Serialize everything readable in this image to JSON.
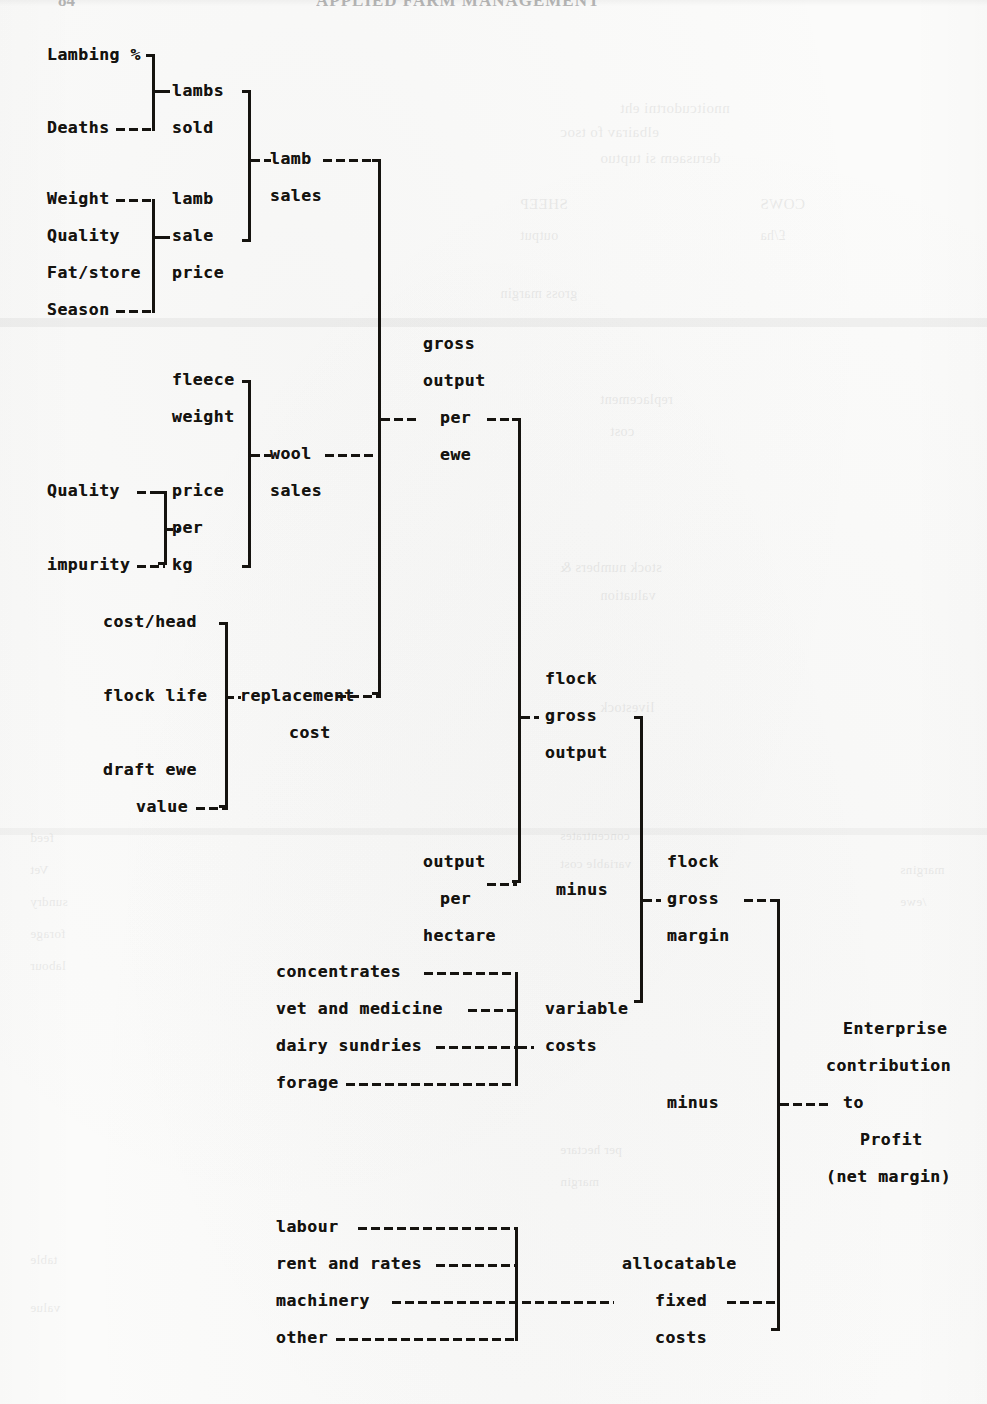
{
  "page": {
    "folio": "84",
    "running_head": "APPLIED FARM MANAGEMENT",
    "background_color": "#fbfbfa",
    "ink_color": "#15130f"
  },
  "diagram": {
    "type": "tree",
    "nodes": {
      "lambing_percent": "Lambing %",
      "deaths": "Deaths",
      "lambs": "lambs",
      "sold": "sold",
      "weight": "Weight",
      "quality_lamb": "Quality",
      "fat_store": "Fat/store",
      "season": "Season",
      "lamb_word": "lamb",
      "sale_word": "sale",
      "price_word": "price",
      "lamb": "lamb",
      "sales_lamb": "sales",
      "fleece": "fleece",
      "fleece_weight": "weight",
      "quality_wool": "Quality",
      "impurity": "impurity",
      "price_wool": "price",
      "per_wool": "per",
      "kg": "kg",
      "wool": "wool",
      "sales_wool": "sales",
      "cost_head": "cost/head",
      "flock_life": "flock life",
      "draft_ewe": "draft ewe",
      "value": "value",
      "replacement": "replacement",
      "replacement_cost": "cost",
      "gross": "gross",
      "output_gross": "output",
      "per_ewe_per": "per",
      "ewe": "ewe",
      "flock_go_1": "flock",
      "flock_go_2": "gross",
      "flock_go_3": "output",
      "output_ha_1": "output",
      "output_ha_2": "per",
      "output_ha_3": "hectare",
      "minus_vc": "minus",
      "flock_gm_1": "flock",
      "flock_gm_2": "gross",
      "flock_gm_3": "margin",
      "concentrates": "concentrates",
      "vet_and_medicine": "vet and medicine",
      "dairy_sundries": "dairy sundries",
      "forage": "forage",
      "variable": "variable",
      "costs_variable": "costs",
      "minus_fixed": "minus",
      "enterprise_1": "Enterprise",
      "enterprise_2": "contribution",
      "enterprise_3": "to",
      "enterprise_4": "Profit",
      "enterprise_5": "(net margin)",
      "labour": "labour",
      "rent_and_rates": "rent and rates",
      "machinery": "machinery",
      "other": "other",
      "allocatable": "allocatable",
      "fixed": "fixed",
      "costs_fixed": "costs"
    },
    "groups": [
      {
        "name": "lambs-sold",
        "inputs": [
          "Lambing %",
          "Deaths"
        ],
        "output": [
          "lambs",
          "sold"
        ]
      },
      {
        "name": "lamb-sale-price",
        "inputs": [
          "Weight",
          "Quality",
          "Fat/store",
          "Season"
        ],
        "output": [
          "lamb",
          "sale",
          "price"
        ]
      },
      {
        "name": "lamb-sales",
        "inputs": [
          "lambs sold",
          "lamb sale price"
        ],
        "output": [
          "lamb",
          "sales"
        ]
      },
      {
        "name": "wool-price-per-kg",
        "inputs": [
          "Quality",
          "impurity"
        ],
        "output": [
          "price",
          "per",
          "kg"
        ]
      },
      {
        "name": "wool-sales",
        "inputs": [
          "fleece weight",
          "price per kg"
        ],
        "output": [
          "wool",
          "sales"
        ]
      },
      {
        "name": "replacement-cost",
        "inputs": [
          "cost/head",
          "flock life",
          "draft ewe value"
        ],
        "output": [
          "replacement",
          "cost"
        ]
      },
      {
        "name": "gross-output-per-ewe",
        "inputs": [
          "lamb sales",
          "wool sales",
          "replacement cost"
        ],
        "output": [
          "gross",
          "output",
          "per",
          "ewe"
        ]
      },
      {
        "name": "flock-gross-output",
        "inputs": [
          "gross output per ewe",
          "output per hectare"
        ],
        "output": [
          "flock",
          "gross",
          "output"
        ]
      },
      {
        "name": "variable-costs",
        "inputs": [
          "concentrates",
          "vet and medicine",
          "dairy sundries",
          "forage"
        ],
        "output": [
          "variable",
          "costs"
        ]
      },
      {
        "name": "flock-gross-margin",
        "inputs": [
          "flock gross output",
          "minus",
          "variable costs"
        ],
        "output": [
          "flock",
          "gross",
          "margin"
        ]
      },
      {
        "name": "allocatable-fixed-costs",
        "inputs": [
          "labour",
          "rent and rates",
          "machinery",
          "other"
        ],
        "output": [
          "allocatable",
          "fixed",
          "costs"
        ]
      },
      {
        "name": "enterprise-contribution",
        "inputs": [
          "flock gross margin",
          "minus",
          "allocatable fixed costs"
        ],
        "output": [
          "Enterprise",
          "contribution",
          "to",
          "Profit",
          "(net margin)"
        ]
      }
    ]
  }
}
